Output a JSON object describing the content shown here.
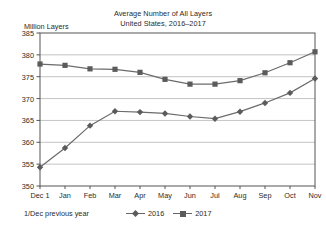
{
  "chart_data": {
    "type": "line",
    "title": "Average Number of All Layers",
    "subtitle": "United States, 2016–2017",
    "ylabel": "Million Layers",
    "xlabel": "",
    "ylim": [
      350,
      385
    ],
    "yticks": [
      350,
      355,
      360,
      365,
      370,
      375,
      380,
      385
    ],
    "grid": true,
    "legend_position": "bottom",
    "categories": [
      "Dec 1",
      "Jan",
      "Feb",
      "Mar",
      "Apr",
      "May",
      "Jun",
      "Jul",
      "Aug",
      "Sep",
      "Oct",
      "Nov"
    ],
    "series": [
      {
        "name": "2016",
        "marker": "diamond",
        "color": "#5b5b5b",
        "values": [
          354.3,
          358.7,
          363.8,
          367.1,
          366.9,
          366.6,
          365.9,
          365.4,
          367.0,
          369.0,
          371.3,
          374.6
        ]
      },
      {
        "name": "2017",
        "marker": "square",
        "color": "#5b5b5b",
        "values": [
          377.9,
          377.6,
          376.8,
          376.7,
          376.0,
          374.4,
          373.3,
          373.3,
          374.1,
          375.9,
          378.2,
          380.7
        ]
      }
    ],
    "footnote": "1/Dec previous year"
  },
  "style": {
    "line_color": "#6b6b6b",
    "marker_color": "#5b5b5b",
    "grid_color": "#b4b4b4",
    "axis_color": "#555555",
    "text_color": "#2b2b2b"
  }
}
